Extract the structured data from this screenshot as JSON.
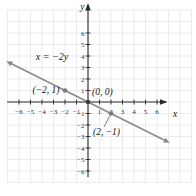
{
  "chart_data": {
    "type": "line",
    "title": "",
    "equation_label": "x = −2y",
    "axes": {
      "x_label": "x",
      "y_label": "y",
      "x_ticks": [
        -6,
        -5,
        -4,
        -3,
        -2,
        -1,
        1,
        2,
        3,
        4,
        5,
        6
      ],
      "y_ticks": [
        -6,
        -5,
        -4,
        -3,
        -2,
        -1,
        1,
        2,
        3,
        4,
        5,
        6
      ],
      "xlim": [
        -6.9,
        6.9
      ],
      "ylim": [
        -6.9,
        6.9
      ],
      "grid": true
    },
    "line": {
      "from": {
        "x": -6.87,
        "y": 3.43
      },
      "to": {
        "x": 6.87,
        "y": -3.43
      },
      "arrow_both_ends": true
    },
    "points": [
      {
        "x": -2,
        "y": 1,
        "label": "(−2, 1)",
        "label_side": "left"
      },
      {
        "x": 0,
        "y": 0,
        "label": "(0, 0)",
        "label_side": "upper-right"
      },
      {
        "x": 2,
        "y": -1,
        "label": "(2, −1)",
        "label_side": "below",
        "leader_line": true
      }
    ],
    "colors": {
      "background": "#ffffff",
      "grid": "#e6e6e8",
      "axis": "#2a2a2a",
      "tick_label": "#2e2e2e",
      "line": "#898b8c",
      "point": "#77797a",
      "origin_point": "#3c3c3c",
      "leader": "#55575a",
      "label": "#141414"
    }
  }
}
